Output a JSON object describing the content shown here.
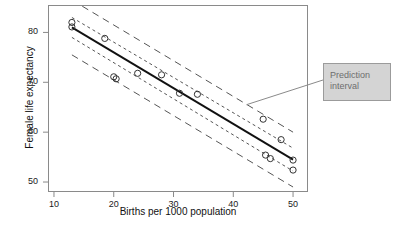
{
  "chart_data": {
    "type": "scatter",
    "title": "",
    "xlabel": "Births per 1000 population",
    "ylabel": "Female life expectancy",
    "xlim": [
      9.0,
      52.5
    ],
    "ylim": [
      48.0,
      85.5
    ],
    "xticks": [
      10,
      20,
      30,
      40,
      50
    ],
    "yticks": [
      50,
      60,
      70,
      80
    ],
    "xtick_labels": [
      "10",
      "20",
      "30",
      "40",
      "50"
    ],
    "ytick_labels": [
      "50",
      "60",
      "70",
      "80"
    ],
    "grid": false,
    "legend": "none",
    "marker": "open-circle",
    "points": [
      {
        "x": 13.0,
        "y": 82.0
      },
      {
        "x": 13.0,
        "y": 81.1
      },
      {
        "x": 18.5,
        "y": 78.8
      },
      {
        "x": 20.0,
        "y": 71.1
      },
      {
        "x": 20.4,
        "y": 70.7
      },
      {
        "x": 24.0,
        "y": 71.8
      },
      {
        "x": 28.0,
        "y": 71.5
      },
      {
        "x": 31.0,
        "y": 67.8
      },
      {
        "x": 34.0,
        "y": 67.6
      },
      {
        "x": 45.0,
        "y": 62.6
      },
      {
        "x": 45.4,
        "y": 55.4
      },
      {
        "x": 46.2,
        "y": 54.7
      },
      {
        "x": 48.0,
        "y": 58.5
      },
      {
        "x": 50.0,
        "y": 54.4
      },
      {
        "x": 50.0,
        "y": 52.4
      }
    ],
    "series": [
      {
        "name": "Regression line",
        "style": "solid",
        "x": [
          13.0,
          50.0
        ],
        "y": [
          81.0,
          54.5
        ]
      },
      {
        "name": "Confidence interval upper",
        "style": "short-dash",
        "x": [
          13.0,
          50.0
        ],
        "y": [
          83.0,
          56.8
        ]
      },
      {
        "name": "Confidence interval lower",
        "style": "short-dash",
        "x": [
          13.0,
          50.0
        ],
        "y": [
          79.0,
          52.2
        ]
      },
      {
        "name": "Prediction interval upper",
        "style": "long-dash",
        "x": [
          13.0,
          50.0
        ],
        "y": [
          86.5,
          60.0
        ]
      },
      {
        "name": "Prediction interval lower",
        "style": "long-dash",
        "x": [
          13.0,
          50.0
        ],
        "y": [
          75.5,
          49.0
        ]
      }
    ],
    "annotations": [
      {
        "name": "prediction-interval-callout",
        "text": "Prediction interval",
        "text_line_1": "Prediction",
        "text_line_2": "interval",
        "leader_from_x": 42.2,
        "leader_from_y": 65.5
      }
    ],
    "colors": {
      "frame": "#8a8a8a",
      "line": "#111111",
      "marker_stroke": "#333333",
      "interval": "#555555",
      "callout_fill": "#d4d4d4",
      "callout_border": "#9b9b9b",
      "callout_text": "#6e6e6e",
      "background": "#ffffff"
    }
  }
}
